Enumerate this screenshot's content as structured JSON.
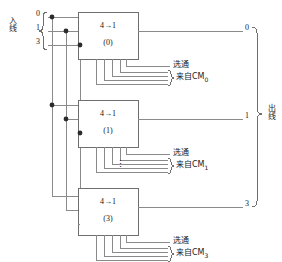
{
  "diagram": {
    "input_group": {
      "label": "入线",
      "line_labels": [
        "0",
        "1",
        "3"
      ]
    },
    "output_group": {
      "label": "出线",
      "line_labels": [
        "0",
        "1",
        "3"
      ]
    },
    "blocks": [
      {
        "type": "4→1",
        "index": "(0)",
        "strobe": "选通",
        "source_prefix": "来自CM",
        "source_sub": "0"
      },
      {
        "type": "4→1",
        "index": "(1)",
        "strobe": "选通",
        "source_prefix": "来自CM",
        "source_sub": "1"
      },
      {
        "type": "4→1",
        "index": "(3)",
        "strobe": "选通",
        "source_prefix": "来自CM",
        "source_sub": "3"
      }
    ],
    "ellipsis": "⋮",
    "colors": {
      "line": "#8a8a8a",
      "box_border": "#6f6f6f",
      "dot": "#2b2b2b",
      "text": "#1a1a1a",
      "background": "#ffffff"
    }
  }
}
